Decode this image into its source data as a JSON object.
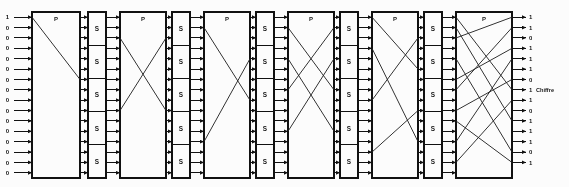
{
  "figure": {
    "output_label": "Chiffre",
    "block_label_permutation": "P",
    "block_label_substitution": "S",
    "bit_count": 16,
    "sbox_rows": 5,
    "stage_count": 11
  },
  "colors": {
    "ink": "#1a1a1a",
    "line": "#2b2b2b",
    "box_fill": "#fdfdfd",
    "background": "#ffffff"
  },
  "inputs": {
    "name": "input-bits",
    "values": [
      "1",
      "0",
      "0",
      "0",
      "0",
      "0",
      "0",
      "0",
      "0",
      "0",
      "0",
      "0",
      "0",
      "0",
      "0",
      "0"
    ]
  },
  "outputs": {
    "name": "output-bits",
    "values": [
      "1",
      "1",
      "0",
      "1",
      "1",
      "1",
      "0",
      "1",
      "1",
      "0",
      "1",
      "1",
      "1",
      "0",
      "1"
    ],
    "labeled_index": 7,
    "label": "Chiffre"
  },
  "stages": [
    {
      "id": "p1",
      "type": "P",
      "label": "P",
      "x": 32,
      "width": 48
    },
    {
      "id": "s1",
      "type": "S",
      "label": "S",
      "x": 88,
      "width": 18
    },
    {
      "id": "p2",
      "type": "P",
      "label": "P",
      "x": 120,
      "width": 46
    },
    {
      "id": "s2",
      "type": "S",
      "label": "S",
      "x": 172,
      "width": 18
    },
    {
      "id": "p3",
      "type": "P",
      "label": "P",
      "x": 204,
      "width": 46
    },
    {
      "id": "s3",
      "type": "S",
      "label": "S",
      "x": 256,
      "width": 18
    },
    {
      "id": "p4",
      "type": "P",
      "label": "P",
      "x": 288,
      "width": 46
    },
    {
      "id": "s4",
      "type": "S",
      "label": "S",
      "x": 340,
      "width": 18
    },
    {
      "id": "p5",
      "type": "P",
      "label": "P",
      "x": 372,
      "width": 46
    },
    {
      "id": "s5",
      "type": "S",
      "label": "S",
      "x": 424,
      "width": 18
    },
    {
      "id": "p6",
      "type": "P",
      "label": "P",
      "x": 456,
      "width": 56
    }
  ],
  "permutation_wires": {
    "p1": [
      [
        0,
        6
      ]
    ],
    "p2": [
      [
        2,
        9
      ],
      [
        9,
        2
      ]
    ],
    "p3": [
      [
        1,
        8
      ],
      [
        12,
        4
      ]
    ],
    "p4": [
      [
        1,
        7
      ],
      [
        4,
        11
      ],
      [
        7,
        1
      ],
      [
        11,
        4
      ]
    ],
    "p5": [
      [
        0,
        5
      ],
      [
        3,
        12
      ],
      [
        8,
        2
      ],
      [
        13,
        9
      ]
    ],
    "p6": [
      [
        0,
        7
      ],
      [
        1,
        10
      ],
      [
        2,
        0
      ],
      [
        4,
        13
      ],
      [
        6,
        3
      ],
      [
        7,
        1
      ],
      [
        9,
        6
      ],
      [
        10,
        14
      ],
      [
        12,
        4
      ],
      [
        14,
        8
      ]
    ]
  }
}
